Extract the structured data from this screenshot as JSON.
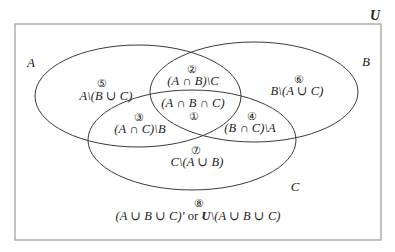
{
  "diagram": {
    "type": "venn-3-set",
    "universe_label": "U",
    "sets": [
      {
        "id": "A",
        "label": "A"
      },
      {
        "id": "B",
        "label": "B"
      },
      {
        "id": "C",
        "label": "C"
      }
    ],
    "regions": [
      {
        "number": "①",
        "expression": "(A ∩ B ∩ C)"
      },
      {
        "number": "②",
        "expression": "(A ∩ B)\\C"
      },
      {
        "number": "③",
        "expression": "(A ∩ C)\\B"
      },
      {
        "number": "④",
        "expression": "(B ∩ C)\\A"
      },
      {
        "number": "⑤",
        "expression": "A\\(B ∪ C)"
      },
      {
        "number": "⑥",
        "expression": "B\\(A ∪ C)"
      },
      {
        "number": "⑦",
        "expression": "C\\(A ∪ B)"
      },
      {
        "number": "⑧",
        "expression_part1": "(A ∪ B ∪ C)′",
        "connector": "or",
        "expression_part2_universe": "U",
        "expression_part2_rest": "\\(A ∪ B ∪ C)"
      }
    ],
    "colors": {
      "outline": "#3a3a3a",
      "border": "#9a9a9a",
      "text": "#222222",
      "background": "#ffffff"
    }
  }
}
